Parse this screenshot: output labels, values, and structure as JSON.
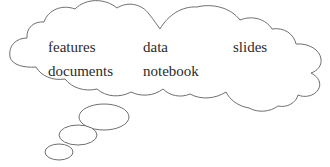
{
  "diagram": {
    "type": "thought-bubble",
    "stroke_color": "#6f6f6f",
    "fill_color": "#ffffff",
    "text_color": "#2b2b2b",
    "words": [
      {
        "label": "features",
        "x": 48,
        "y": 40
      },
      {
        "label": "data",
        "x": 143,
        "y": 40
      },
      {
        "label": "slides",
        "x": 233,
        "y": 40
      },
      {
        "label": "documents",
        "x": 48,
        "y": 64
      },
      {
        "label": "notebook",
        "x": 143,
        "y": 64
      }
    ],
    "tail_bubbles": [
      {
        "name": "tail-bubble-large",
        "cx": 104,
        "cy": 117,
        "rx": 25,
        "ry": 13
      },
      {
        "name": "tail-bubble-medium",
        "cx": 78,
        "cy": 135,
        "rx": 19,
        "ry": 10
      },
      {
        "name": "tail-bubble-small",
        "cx": 59,
        "cy": 152,
        "rx": 14,
        "ry": 8
      }
    ]
  }
}
